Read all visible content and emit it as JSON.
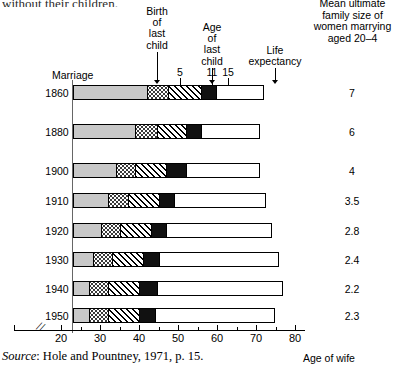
{
  "page": {
    "top_cut_text": "without their children.",
    "source_prefix": "Source",
    "source_text": ": Hole and Pountney, 1971, p. 15.",
    "axis_title": "Age of wife",
    "marriage_label": "Marriage"
  },
  "right_header": {
    "line1": "Mean ultimate",
    "line2": "family size of",
    "line3": "women marrying",
    "line4": "aged 20–4"
  },
  "callouts": [
    {
      "id": "birth-of-last-child",
      "lines": [
        "Birth",
        "of",
        "last",
        "child"
      ],
      "x": 157
    },
    {
      "id": "age-of-last-child",
      "lines": [
        "Age",
        "of",
        "last",
        "child"
      ],
      "x": 212
    },
    {
      "id": "life-expectancy",
      "lines": [
        "Life",
        "expectancy"
      ],
      "x": 275
    }
  ],
  "child_age_marks": [
    {
      "label": "5",
      "x": 180
    },
    {
      "label": "11",
      "x": 212
    },
    {
      "label": "15",
      "x": 228
    }
  ],
  "chart_data": {
    "type": "bar",
    "xlabel": "Age of wife",
    "ylabel": "",
    "xlim": [
      20,
      80
    ],
    "xticks": [
      20,
      25,
      30,
      35,
      40,
      45,
      50,
      55,
      60,
      65,
      70,
      75,
      80
    ],
    "xtick_labels": [
      "20",
      "",
      "30",
      "",
      "40",
      "",
      "50",
      "",
      "60",
      "",
      "70",
      "",
      "80"
    ],
    "axis_break": true,
    "grid": false,
    "legend": "none",
    "segment_names": [
      "marriage to birth of last child",
      "last child age 0-5",
      "last child age 5-11",
      "last child age 11-15",
      "after last child aged 15 to life expectancy"
    ],
    "categories": [
      "1860",
      "1880",
      "1900",
      "1910",
      "1920",
      "1930",
      "1940",
      "1950"
    ],
    "rows": [
      {
        "year": "1860",
        "marriage_age": 23,
        "birth_last_child": 42,
        "child_age_5": 47.5,
        "child_age_11": 56,
        "child_age_15": 60,
        "life_expectancy": 72,
        "mean_family_size": "7"
      },
      {
        "year": "1880",
        "marriage_age": 23,
        "birth_last_child": 39,
        "child_age_5": 44.5,
        "child_age_11": 52,
        "child_age_15": 56,
        "life_expectancy": 71,
        "mean_family_size": "6"
      },
      {
        "year": "1900",
        "marriage_age": 23,
        "birth_last_child": 34,
        "child_age_5": 39,
        "child_age_11": 47,
        "child_age_15": 52,
        "life_expectancy": 71,
        "mean_family_size": "4"
      },
      {
        "year": "1910",
        "marriage_age": 23,
        "birth_last_child": 32,
        "child_age_5": 37,
        "child_age_11": 45,
        "child_age_15": 49,
        "life_expectancy": 72.5,
        "mean_family_size": "3.5"
      },
      {
        "year": "1920",
        "marriage_age": 23,
        "birth_last_child": 30,
        "child_age_5": 35,
        "child_age_11": 43,
        "child_age_15": 47,
        "life_expectancy": 74,
        "mean_family_size": "2.8"
      },
      {
        "year": "1930",
        "marriage_age": 23,
        "birth_last_child": 28,
        "child_age_5": 33,
        "child_age_11": 41,
        "child_age_15": 45,
        "life_expectancy": 76,
        "mean_family_size": "2.4"
      },
      {
        "year": "1940",
        "marriage_age": 23,
        "birth_last_child": 27,
        "child_age_5": 32,
        "child_age_11": 40,
        "child_age_15": 44.5,
        "life_expectancy": 77,
        "mean_family_size": "2.2"
      },
      {
        "year": "1950",
        "marriage_age": 23,
        "birth_last_child": 27,
        "child_age_5": 32,
        "child_age_11": 40,
        "child_age_15": 44,
        "life_expectancy": 75,
        "mean_family_size": "2.3"
      }
    ]
  },
  "colors": {
    "segment_marriage": "#c8c8c8",
    "segment_black": "#111111",
    "segment_white": "#ffffff",
    "axis": "#000000"
  }
}
